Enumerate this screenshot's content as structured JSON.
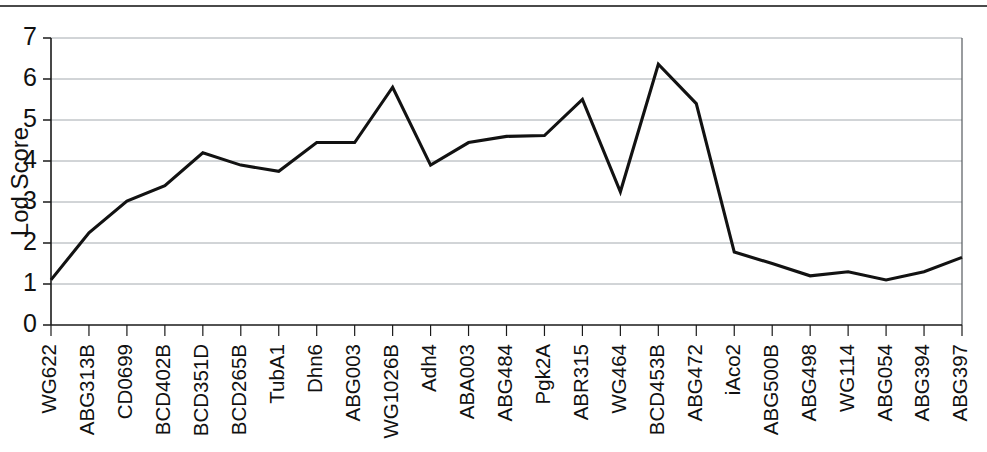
{
  "chart_data": {
    "type": "line",
    "title": "",
    "xlabel": "",
    "ylabel": "Lod Score",
    "ylim": [
      0,
      7
    ],
    "yticks": [
      0,
      1,
      2,
      3,
      4,
      5,
      6,
      7
    ],
    "grid": true,
    "legend": "none",
    "line_color": "#121212",
    "grid_color": "#9aa0a6",
    "axis_color": "#1a1a1a",
    "categories": [
      "WG622",
      "ABG313B",
      "CD0699",
      "BCD402B",
      "BCD351D",
      "BCD265B",
      "TubA1",
      "Dhn6",
      "ABG003",
      "WG1026B",
      "Adh4",
      "ABA003",
      "ABG484",
      "Pgk2A",
      "ABR315",
      "WG464",
      "BCD453B",
      "ABG472",
      "iAco2",
      "ABG500B",
      "ABG498",
      "WG114",
      "ABG054",
      "ABG394",
      "ABG397"
    ],
    "values": [
      1.1,
      2.25,
      3.02,
      3.4,
      4.2,
      3.9,
      3.75,
      4.45,
      4.45,
      5.8,
      3.9,
      4.45,
      4.6,
      4.62,
      5.5,
      3.25,
      6.36,
      5.4,
      1.78,
      1.5,
      1.2,
      1.3,
      1.1,
      1.3,
      1.65
    ],
    "series_name": "Lod Score"
  },
  "figure": {
    "top_rule": true,
    "background": "#ffffff"
  }
}
